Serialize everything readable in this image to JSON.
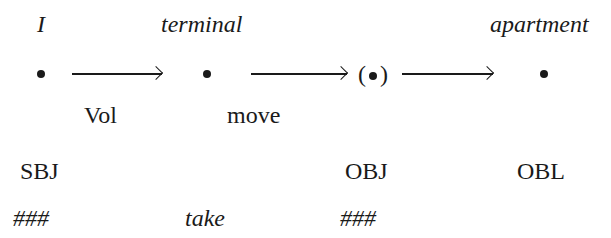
{
  "diagram": {
    "participants": [
      {
        "label": "I",
        "italic": true
      },
      {
        "label": "terminal",
        "italic": true
      },
      {
        "label": "",
        "optional": true,
        "paren_open": "(",
        "paren_close": ")"
      },
      {
        "label": "apartment",
        "italic": true
      }
    ],
    "relations": [
      {
        "label": "Vol",
        "from": 0,
        "to": 1
      },
      {
        "label": "move",
        "from": 1,
        "to": 2
      },
      {
        "label": "",
        "from": 2,
        "to": 3
      }
    ],
    "roles": [
      "SBJ",
      "",
      "OBJ",
      "OBL"
    ],
    "bottom_row": [
      "###",
      "take",
      "###",
      ""
    ]
  }
}
